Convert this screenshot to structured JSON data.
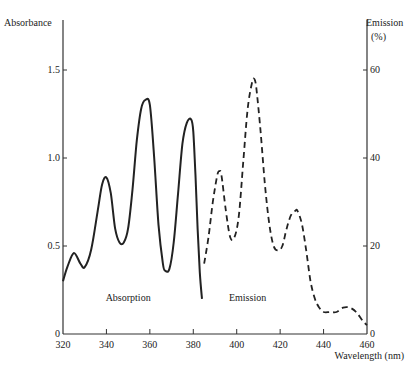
{
  "chart_data": {
    "type": "line",
    "title": "",
    "xlabel": "Wavelength (nm)",
    "ylabel_left": "Absorbance",
    "ylabel_right": "Emission (%)",
    "ylabel_right_line1": "Emission",
    "ylabel_right_line2": "(%)",
    "xlim": [
      320,
      460
    ],
    "ylim_left": [
      0,
      1.7
    ],
    "ylim_right": [
      0,
      68
    ],
    "x_ticks": [
      320,
      340,
      360,
      380,
      400,
      420,
      440,
      460
    ],
    "x_tick_labels": [
      "320",
      "340",
      "360",
      "380",
      "400",
      "420",
      "440",
      "460"
    ],
    "y_left_ticks": [
      0,
      0.5,
      1.0,
      1.5
    ],
    "y_left_tick_labels": [
      "0",
      "0.5",
      "1.0",
      "1.5"
    ],
    "y_right_ticks": [
      0,
      20,
      40,
      60
    ],
    "y_right_tick_labels": [
      "0",
      "20",
      "40",
      "60"
    ],
    "grid": false,
    "series": [
      {
        "name": "Absorption",
        "axis": "left",
        "style": "solid",
        "label": "Absorption",
        "x": [
          320,
          322,
          325,
          328,
          330,
          333,
          336,
          338,
          340,
          342,
          344,
          346,
          348,
          350,
          352,
          354,
          356,
          358,
          360,
          362,
          364,
          366,
          367,
          369,
          371,
          373,
          375,
          377,
          379,
          380,
          381,
          382,
          383,
          384
        ],
        "y": [
          0.3,
          0.38,
          0.46,
          0.4,
          0.38,
          0.48,
          0.7,
          0.85,
          0.89,
          0.8,
          0.6,
          0.52,
          0.52,
          0.6,
          0.82,
          1.1,
          1.28,
          1.33,
          1.3,
          1.0,
          0.62,
          0.4,
          0.36,
          0.37,
          0.52,
          0.8,
          1.08,
          1.2,
          1.22,
          1.15,
          0.9,
          0.6,
          0.35,
          0.2
        ]
      },
      {
        "name": "Emission",
        "axis": "right",
        "style": "dashed",
        "label": "Emission",
        "x": [
          385,
          387,
          389,
          391,
          392,
          393,
          395,
          397,
          399,
          401,
          403,
          405,
          407,
          408,
          409,
          411,
          413,
          415,
          417,
          419,
          421,
          423,
          425,
          427,
          428,
          430,
          432,
          434,
          436,
          438,
          440,
          443,
          446,
          449,
          452,
          455,
          458,
          460
        ],
        "y": [
          16,
          22,
          30,
          36,
          37,
          36,
          28,
          22,
          22,
          27,
          39,
          51,
          57,
          58,
          56,
          46,
          34,
          25,
          20,
          19,
          20,
          24,
          27,
          28,
          28,
          25,
          19,
          12,
          8,
          6,
          5,
          5,
          5,
          6,
          6,
          5,
          3,
          2
        ]
      }
    ],
    "annotations": [
      {
        "text": "Absorption",
        "x": 350,
        "y_left": 0.2
      },
      {
        "text": "Emission",
        "x": 405,
        "y_left": 0.2
      }
    ]
  }
}
